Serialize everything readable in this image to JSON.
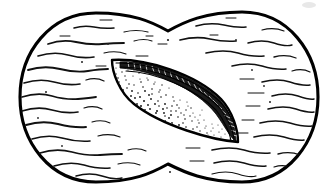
{
  "figure": {
    "title": "Bilobed sectioned body with embedded lens-shaped seed",
    "caption": "",
    "medium": "black-and-white pen-and-ink line drawing",
    "background_color": "#ffffff",
    "ink_color": "#000000",
    "canvas": {
      "width": 336,
      "height": 195
    }
  },
  "outer_body": {
    "name": "bilobed-outline",
    "description": "Peanut-shaped closed outline formed by two overlapping rounded lobes with a concave notch at top center and bottom center",
    "stroke_color": "#000000",
    "stroke_width": 3.1,
    "fill_color": "#ffffff",
    "bounds": {
      "left": 20,
      "top": 12,
      "right": 318,
      "bottom": 182
    },
    "lobes": [
      {
        "label": "left-lobe",
        "center_x": 96,
        "center_y": 99,
        "radius_x": 76,
        "radius_y": 85
      },
      {
        "label": "right-lobe",
        "center_x": 242,
        "center_y": 97,
        "radius_x": 76,
        "radius_y": 85
      }
    ],
    "notch_top": {
      "x": 168,
      "y": 30
    },
    "notch_bottom": {
      "x": 168,
      "y": 166
    }
  },
  "texture": {
    "name": "wavy-horizontal-hatching",
    "description": "Irregular broken wavy horizontal dashes filling the outer body, suggesting fibrous or fleshy tissue",
    "stroke_color": "#111111",
    "row_count": 17,
    "row_spacing": 10,
    "dash_min_length": 8,
    "dash_max_length": 62,
    "stroke_width_range": [
      0.9,
      2.2
    ]
  },
  "seed": {
    "name": "lens-shaped-seed",
    "description": "Almond / lens shaped body tilted with long axis running from upper-left to lower-right, pointed at both ends",
    "fill_color": "#ffffff",
    "stroke_color": "#000000",
    "stroke_width": 2.4,
    "tip_upper_left": {
      "x": 112,
      "y": 60
    },
    "tip_lower_right": {
      "x": 238,
      "y": 142
    },
    "center": {
      "x": 175,
      "y": 101
    },
    "length": 150,
    "max_width": 66,
    "tilt_degrees": 33
  },
  "seed_interior": {
    "stipple": {
      "name": "stipple-shading",
      "description": "Dense field of fine dots shading the lower-left face of the seed, thinning toward the upper-right margin",
      "dot_color": "#141414",
      "dot_count": 430,
      "dot_radius_min": 0.5,
      "dot_radius_max": 1.15,
      "density": "dense at lower-left, sparse at upper-right"
    },
    "raphe": {
      "name": "raphe-band",
      "description": "Thick dark serrated band with fine transverse ticks running along the upper-right margin of the seed",
      "fill_color": "#1a1a1a",
      "tick_color": "#ffffff",
      "tick_count": 46
    },
    "margin_lines": {
      "name": "double-margin-lines",
      "description": "Two fine parallel contour lines tracing just inside the seed outline along the upper-right and lower-right margins",
      "stroke_color": "#000000",
      "stroke_width": 1.1,
      "count": 3
    }
  },
  "specks": {
    "name": "scattered-specks",
    "description": "Small isolated ink specks scattered across the hatched field",
    "color": "#222222",
    "count": 11
  },
  "artifacts": {
    "name": "scan-artifact",
    "description": "Faint light-grey smudge near the upper right corner of the scan",
    "color": "#e8e8e8",
    "position": {
      "x": 308,
      "y": 5
    }
  }
}
